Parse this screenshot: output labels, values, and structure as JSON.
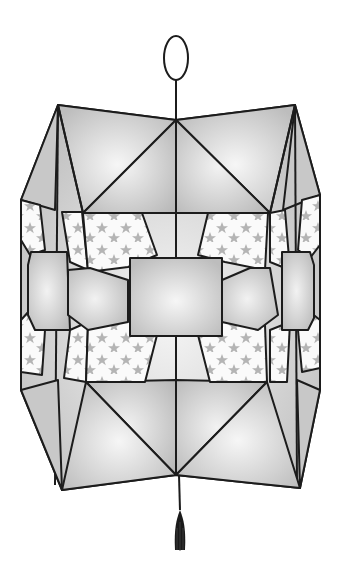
{
  "image": {
    "subject": "paper lantern illustration",
    "description": "Geometric folded paper lantern with star-patterned panels, hanging loop on top and tassel at bottom"
  },
  "colors": {
    "background": "#ffffff",
    "outline": "#1c1c1c",
    "panel_gray": "#c4c4c4",
    "panel_highlight": "#f4f4f4",
    "star_panel": "#fafafa",
    "star": "#b4b4b4",
    "tassel": "#1a1a1a"
  },
  "parts": {
    "hanging_loop": "oval loop",
    "cord": "vertical cord",
    "body": "faceted lantern body",
    "star_panels": "star pattern panels",
    "center_window": "square center panel",
    "tassel": "black tassel"
  }
}
